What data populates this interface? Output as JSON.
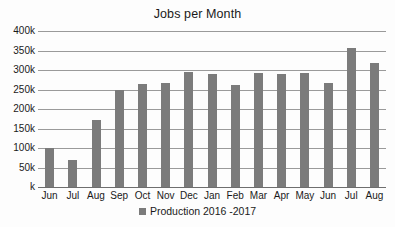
{
  "chart_data": {
    "type": "bar",
    "title": "Jobs per Month",
    "xlabel": "",
    "ylabel": "",
    "ylim": [
      0,
      400000
    ],
    "grid": true,
    "legend_position": "bottom",
    "categories": [
      "Jun",
      "Jul",
      "Aug",
      "Sep",
      "Oct",
      "Nov",
      "Dec",
      "Jan",
      "Feb",
      "Mar",
      "Apr",
      "May",
      "Jun",
      "Jul",
      "Aug"
    ],
    "values": [
      100000,
      70000,
      172000,
      249000,
      265000,
      267000,
      294000,
      289000,
      261000,
      293000,
      291000,
      293000,
      266000,
      357000,
      318000
    ],
    "series": [
      {
        "name": "Production 2016 -2017",
        "color": "#7b7b7b",
        "values": [
          100000,
          70000,
          172000,
          249000,
          265000,
          267000,
          294000,
          289000,
          261000,
          293000,
          291000,
          293000,
          266000,
          357000,
          318000
        ]
      }
    ],
    "y_ticks": [
      {
        "value": 400000,
        "label": "400k"
      },
      {
        "value": 350000,
        "label": "350k"
      },
      {
        "value": 300000,
        "label": "300k"
      },
      {
        "value": 250000,
        "label": "250k"
      },
      {
        "value": 200000,
        "label": "200k"
      },
      {
        "value": 150000,
        "label": "150k"
      },
      {
        "value": 100000,
        "label": "100k"
      },
      {
        "value": 50000,
        "label": "50k"
      },
      {
        "value": 0,
        "label": "k"
      }
    ],
    "legend": [
      {
        "label": "Production 2016 -2017",
        "color": "#7b7b7b"
      }
    ]
  },
  "colors": {
    "bar": "#7b7b7b",
    "gridline": "#9a9a9a",
    "axis": "#6e6e6e",
    "text": "#1a1a1a",
    "background": "#fdfdfd"
  }
}
